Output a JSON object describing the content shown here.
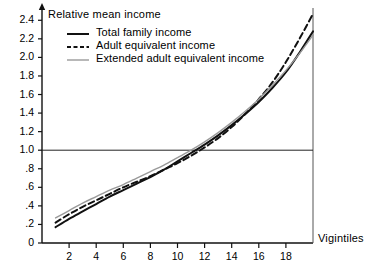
{
  "chart_data": {
    "type": "line",
    "title": "",
    "ylabel": "Relative mean income",
    "xlabel": "Vigintiles",
    "xlim": [
      0,
      20
    ],
    "ylim": [
      0,
      2.5
    ],
    "grid": false,
    "legend_position": "top-left",
    "reference_lines": [
      {
        "axis": "y",
        "value": 1.0,
        "label": "1.0"
      }
    ],
    "y_ticks": [
      {
        "value": 0,
        "label": "0"
      },
      {
        "value": 0.2,
        "label": ".2"
      },
      {
        "value": 0.4,
        "label": ".4"
      },
      {
        "value": 0.6,
        "label": ".6"
      },
      {
        "value": 0.8,
        "label": ".8"
      },
      {
        "value": 1.0,
        "label": "1.0"
      },
      {
        "value": 1.2,
        "label": "1.2"
      },
      {
        "value": 1.4,
        "label": "1.4"
      },
      {
        "value": 1.6,
        "label": "1.6"
      },
      {
        "value": 1.8,
        "label": "1.8"
      },
      {
        "value": 2.0,
        "label": "2.0"
      },
      {
        "value": 2.2,
        "label": "2.2"
      },
      {
        "value": 2.4,
        "label": "2.4"
      }
    ],
    "x_ticks": [
      {
        "value": 2,
        "label": "2"
      },
      {
        "value": 4,
        "label": "4"
      },
      {
        "value": 6,
        "label": "6"
      },
      {
        "value": 8,
        "label": "8"
      },
      {
        "value": 10,
        "label": "10"
      },
      {
        "value": 12,
        "label": "12"
      },
      {
        "value": 14,
        "label": "14"
      },
      {
        "value": 16,
        "label": "16"
      },
      {
        "value": 18,
        "label": "18"
      }
    ],
    "x": [
      1,
      2,
      3,
      4,
      5,
      6,
      7,
      8,
      9,
      10,
      11,
      12,
      13,
      14,
      15,
      16,
      17,
      18,
      19,
      20
    ],
    "series": [
      {
        "name": "Total family income",
        "style": "solid",
        "color": "#111111",
        "values": [
          0.17,
          0.26,
          0.34,
          0.42,
          0.5,
          0.57,
          0.64,
          0.71,
          0.79,
          0.88,
          0.97,
          1.06,
          1.16,
          1.27,
          1.39,
          1.52,
          1.67,
          1.84,
          2.05,
          2.28
        ]
      },
      {
        "name": "Adult equivalent income",
        "style": "dashed",
        "color": "#111111",
        "values": [
          0.22,
          0.31,
          0.39,
          0.46,
          0.53,
          0.6,
          0.66,
          0.72,
          0.79,
          0.86,
          0.94,
          1.03,
          1.13,
          1.25,
          1.39,
          1.55,
          1.73,
          1.95,
          2.2,
          2.47
        ]
      },
      {
        "name": "Extended adult equivalent income",
        "style": "solid-light",
        "color": "#9a9a9a",
        "values": [
          0.27,
          0.35,
          0.43,
          0.5,
          0.57,
          0.63,
          0.7,
          0.77,
          0.84,
          0.92,
          1.0,
          1.09,
          1.19,
          1.3,
          1.42,
          1.55,
          1.7,
          1.86,
          2.04,
          2.24
        ]
      }
    ]
  },
  "legend": {
    "items": [
      {
        "label": "Total family income"
      },
      {
        "label": "Adult equivalent income"
      },
      {
        "label": "Extended adult equivalent income"
      }
    ]
  }
}
